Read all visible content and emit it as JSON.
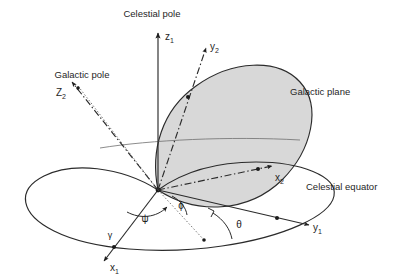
{
  "figure": {
    "background_color": "#ffffff",
    "line_color": "#2b2b2b",
    "plane_fill_color": "#d6d6d6"
  },
  "labels": {
    "celestial_pole": "Celestial pole",
    "galactic_pole": "Galactic pole",
    "galactic_plane": "Galactic plane",
    "celestial_equator": "Celestial equator"
  },
  "axes": [
    {
      "key": "z1",
      "symbol": "z",
      "subscript": "1",
      "style": "solid",
      "system": "celestial",
      "direction": "up",
      "label": "z1"
    },
    {
      "key": "y1",
      "symbol": "y",
      "subscript": "1",
      "style": "solid",
      "system": "celestial",
      "direction": "right",
      "label": "y1"
    },
    {
      "key": "x1",
      "symbol": "x",
      "subscript": "1",
      "style": "solid",
      "system": "celestial",
      "direction": "lower-left",
      "label": "x1"
    },
    {
      "key": "z2",
      "symbol": "Z",
      "subscript": "2",
      "style": "dash-dot",
      "system": "galactic",
      "direction": "upper-left",
      "label": "Z2"
    },
    {
      "key": "y2",
      "symbol": "y",
      "subscript": "2",
      "style": "dash-dot",
      "system": "galactic",
      "direction": "upper-right",
      "label": "y2"
    },
    {
      "key": "x2",
      "symbol": "x",
      "subscript": "2",
      "style": "dash-dot",
      "system": "galactic",
      "direction": "right",
      "label": "x2"
    }
  ],
  "angles": [
    {
      "key": "psi",
      "glyph": "ψ",
      "name": "psi"
    },
    {
      "key": "phi",
      "glyph": "ϕ",
      "name": "phi"
    },
    {
      "key": "theta",
      "glyph": "θ",
      "name": "theta"
    }
  ],
  "points": [
    {
      "key": "vernal_equinox",
      "glyph": "γ",
      "name": "vernal-equinox"
    }
  ],
  "planes": [
    {
      "key": "celestial_equator",
      "label": "Celestial equator",
      "filled": false
    },
    {
      "key": "galactic_plane",
      "label": "Galactic plane",
      "filled": true
    }
  ]
}
